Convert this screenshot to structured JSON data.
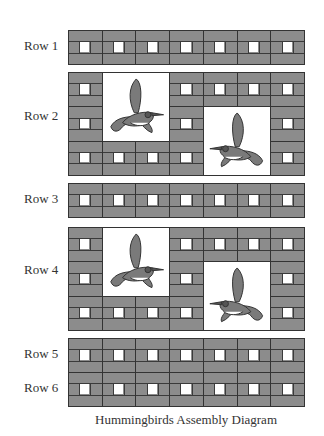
{
  "diagram": {
    "title": "Hummingbirds Assembly Diagram",
    "columns": 7,
    "colors": {
      "block_fill": "#8c8c8c",
      "outline": "#333333",
      "window": "#ffffff",
      "bird_body": "#7a7a7a"
    },
    "rows": [
      {
        "label": "Row 1",
        "type": "plain",
        "block_rows": 1
      },
      {
        "label": "Row 2",
        "type": "hummingbird",
        "block_rows": 3,
        "birds": [
          {
            "col": 1,
            "row": 0,
            "facing": "right"
          },
          {
            "col": 4,
            "row": 1,
            "facing": "left"
          }
        ]
      },
      {
        "label": "Row  3",
        "type": "plain",
        "block_rows": 1
      },
      {
        "label": "Row 4",
        "type": "hummingbird",
        "block_rows": 3,
        "birds": [
          {
            "col": 1,
            "row": 0,
            "facing": "right"
          },
          {
            "col": 4,
            "row": 1,
            "facing": "left"
          }
        ]
      },
      {
        "label": "Row  5",
        "type": "plain",
        "block_rows": 1
      },
      {
        "label": "Row  6",
        "type": "plain",
        "block_rows": 1
      }
    ]
  }
}
